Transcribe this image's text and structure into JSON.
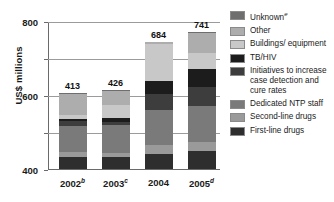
{
  "chart_data": {
    "type": "bar",
    "subtype": "stacked-bar",
    "title": "",
    "xlabel": "",
    "ylabel": "US$ millions",
    "ylim": [
      0,
      800
    ],
    "yticks": [
      0,
      200,
      400,
      600,
      800
    ],
    "grid": true,
    "legend_position": "right",
    "categories": [
      "2002",
      "2003",
      "2004",
      "2005"
    ],
    "category_labels_superscript": [
      "b",
      "c",
      "",
      "d"
    ],
    "totals": [
      413,
      426,
      684,
      741
    ],
    "series": [
      {
        "name": "First-line drugs",
        "color": "#2e2e2e",
        "values": [
          65,
          63,
          80,
          97
        ]
      },
      {
        "name": "Second-line drugs",
        "color": "#9a9a9a",
        "values": [
          25,
          22,
          48,
          48
        ]
      },
      {
        "name": "Dedicated NTP staff",
        "color": "#7a7a7a",
        "values": [
          140,
          155,
          190,
          197
        ]
      },
      {
        "name": "Initiatives to increase case detection and cure rates",
        "color": "#3d3d3d",
        "values": [
          28,
          12,
          85,
          102
        ]
      },
      {
        "name": "TB/HIV",
        "color": "#1c1c1c",
        "values": [
          13,
          22,
          75,
          98
        ]
      },
      {
        "name": "Buildings/ equipment",
        "color": "#c8c8c8",
        "values": [
          22,
          73,
          200,
          88
        ]
      },
      {
        "name": "Other",
        "color": "#adadad",
        "values": [
          113,
          74,
          6,
          105
        ]
      },
      {
        "name": "Unknown",
        "color": "#6e6e6e",
        "values": [
          7,
          5,
          0,
          6
        ]
      }
    ]
  },
  "axis": {
    "y_title": "US$ millions",
    "y_tick_labels": [
      "800",
      "600",
      "400",
      "200",
      "0"
    ],
    "x_tick_labels": [
      {
        "year": "2002",
        "note": "b"
      },
      {
        "year": "2003",
        "note": "c"
      },
      {
        "year": "2004",
        "note": ""
      },
      {
        "year": "2005",
        "note": "d"
      }
    ]
  },
  "bars": [
    {
      "label_year": "2002",
      "label_note": "b",
      "total": "413"
    },
    {
      "label_year": "2003",
      "label_note": "c",
      "total": "426"
    },
    {
      "label_year": "2004",
      "label_note": "",
      "total": "684"
    },
    {
      "label_year": "2005",
      "label_note": "d",
      "total": "741"
    }
  ],
  "legend": {
    "items": [
      {
        "label": "Unknown",
        "note": "e",
        "color": "#6e6e6e"
      },
      {
        "label": "Other",
        "note": "",
        "color": "#adadad"
      },
      {
        "label": "Buildings/ equipment",
        "note": "",
        "color": "#c8c8c8"
      },
      {
        "label": "TB/HIV",
        "note": "",
        "color": "#1c1c1c"
      },
      {
        "label": "Initiatives to increase case detection and cure rates",
        "note": "",
        "color": "#3d3d3d"
      },
      {
        "label": "Dedicated NTP staff",
        "note": "",
        "color": "#7a7a7a"
      },
      {
        "label": "Second-line drugs",
        "note": "",
        "color": "#9a9a9a"
      },
      {
        "label": "First-line drugs",
        "note": "",
        "color": "#2e2e2e"
      }
    ]
  },
  "colors": {
    "background": "#ffffff",
    "axis": "#6a6a6a",
    "gridline": "#9b9b9b",
    "text": "#1a1a1a"
  }
}
